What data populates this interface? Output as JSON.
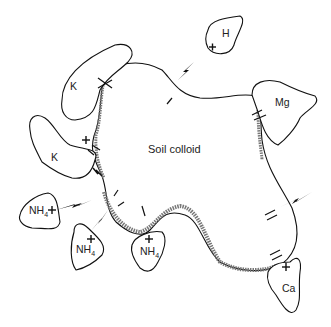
{
  "diagram": {
    "center_label": "Soil colloid",
    "ions": [
      {
        "id": "h",
        "label": "H",
        "x": 222,
        "y": 33
      },
      {
        "id": "k-top",
        "label": "K",
        "x": 71,
        "y": 86
      },
      {
        "id": "mg",
        "label": "Mg",
        "x": 275,
        "y": 101
      },
      {
        "id": "k-mid",
        "label": "K",
        "x": 52,
        "y": 156
      },
      {
        "id": "nh4-left",
        "label": "NH",
        "sub": "4",
        "x": 30,
        "y": 207
      },
      {
        "id": "nh4-mid",
        "label": "NH",
        "sub": "4",
        "x": 77,
        "y": 245
      },
      {
        "id": "nh4-right",
        "label": "NH",
        "sub": "4",
        "x": 142,
        "y": 244
      },
      {
        "id": "ca",
        "label": "Ca",
        "x": 282,
        "y": 278
      }
    ],
    "legend_note": "+ marks indicate cations; - marks indicate negative charges on colloid surface; lightning bolts indicate ion exchange"
  }
}
